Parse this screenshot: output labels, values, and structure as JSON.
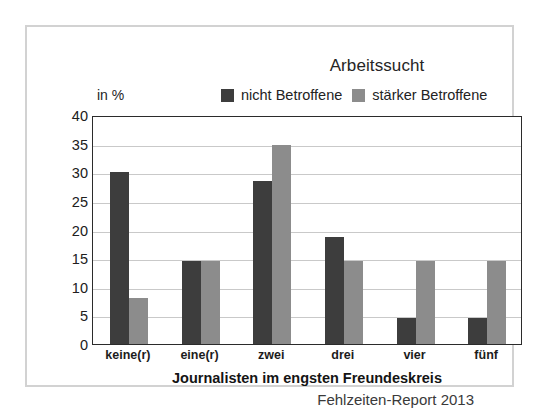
{
  "figure": {
    "title": "Arbeitssucht",
    "unit_label": "in %",
    "source_note": "Fehlzeiten-Report 2013",
    "frame_color": "#d2d2d2",
    "axis_color": "#2b2b2b",
    "grid_color": "#c9c9c9"
  },
  "chart_data": {
    "type": "bar",
    "title": "Arbeitssucht",
    "xlabel": "Journalisten im engsten Freundeskreis",
    "ylabel": "in %",
    "ylim": [
      0,
      40
    ],
    "yticks": [
      0,
      5,
      10,
      15,
      20,
      25,
      30,
      35,
      40
    ],
    "grid": true,
    "legend_position": "top",
    "categories": [
      "keine(r)",
      "eine(r)",
      "zwei",
      "drei",
      "vier",
      "fünf"
    ],
    "series": [
      {
        "name": "nicht Betroffene",
        "color": "#3d3d3d",
        "values": [
          30.0,
          14.5,
          28.5,
          18.7,
          4.5,
          4.5
        ]
      },
      {
        "name": "stärker Betroffene",
        "color": "#8c8c8c",
        "values": [
          8.0,
          14.5,
          34.8,
          14.5,
          14.5,
          14.5
        ]
      }
    ],
    "annotations": [
      "Fehlzeiten-Report 2013"
    ]
  }
}
